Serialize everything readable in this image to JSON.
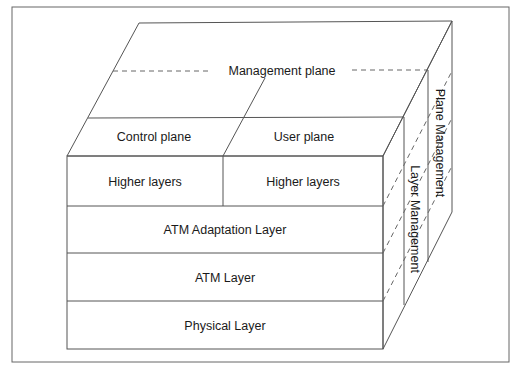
{
  "diagram": {
    "top_face": {
      "management_plane_label": "Management plane",
      "control_plane_label": "Control plane",
      "user_plane_label": "User plane"
    },
    "front_face": {
      "rows": [
        {
          "left": "Higher layers",
          "right": "Higher layers"
        },
        {
          "label": "ATM Adaptation Layer"
        },
        {
          "label": "ATM Layer"
        },
        {
          "label": "Physical Layer"
        }
      ]
    },
    "side_face": {
      "layer_management_label": "Layer Management",
      "plane_management_label": "Plane Management"
    },
    "colors": {
      "line": "#555555",
      "text": "#1a1a1a",
      "background": "#ffffff"
    }
  }
}
